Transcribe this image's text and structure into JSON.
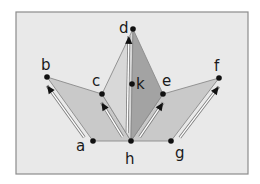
{
  "diagram": {
    "frame": {
      "x": 16,
      "y": 12,
      "width": 232,
      "height": 162,
      "fill": "#e9e9e9",
      "stroke": "#8c8c8c"
    },
    "points": {
      "a": {
        "x": 93,
        "y": 141,
        "label": "a",
        "lx": 76,
        "ly": 151
      },
      "b": {
        "x": 47,
        "y": 77,
        "label": "b",
        "lx": 41,
        "ly": 70
      },
      "c": {
        "x": 102,
        "y": 94,
        "label": "c",
        "lx": 92,
        "ly": 86
      },
      "d": {
        "x": 133,
        "y": 29,
        "label": "d",
        "lx": 119,
        "ly": 33
      },
      "e": {
        "x": 163,
        "y": 94,
        "label": "e",
        "lx": 162,
        "ly": 86
      },
      "f": {
        "x": 219,
        "y": 78,
        "label": "f",
        "lx": 214,
        "ly": 71
      },
      "g": {
        "x": 171,
        "y": 141,
        "label": "g",
        "lx": 175,
        "ly": 158
      },
      "h": {
        "x": 131,
        "y": 141,
        "label": "h",
        "lx": 125,
        "ly": 164
      },
      "k": {
        "x": 132,
        "y": 84,
        "label": "k",
        "lx": 136,
        "ly": 89
      }
    },
    "faces": [
      {
        "name": "left-kite",
        "vertices": [
          "a",
          "b",
          "c",
          "h"
        ],
        "fill": "#c9c9c9"
      },
      {
        "name": "right-kite",
        "vertices": [
          "h",
          "e",
          "f",
          "g"
        ],
        "fill": "#c9c9c9"
      },
      {
        "name": "center-left-triangle",
        "vertices": [
          "c",
          "d",
          "h"
        ],
        "fill": "#d8d8d8"
      },
      {
        "name": "center-right-triangle",
        "vertices": [
          "d",
          "e",
          "h"
        ],
        "fill": "#a3a3a3"
      }
    ],
    "arrows": [
      {
        "from": "a",
        "to": "b",
        "offset": -5
      },
      {
        "from": "h",
        "to": "c",
        "offset": -5
      },
      {
        "from": "h",
        "to": "d",
        "offset": -4
      },
      {
        "from": "h",
        "to": "e",
        "offset": 5
      },
      {
        "from": "g",
        "to": "f",
        "offset": 5
      }
    ],
    "colors": {
      "edge": "#8a8a8a",
      "point": "#111111",
      "arrow_line": "#ffffff",
      "arrow_outline": "#7a7a7a",
      "arrow_head": "#111111"
    }
  }
}
